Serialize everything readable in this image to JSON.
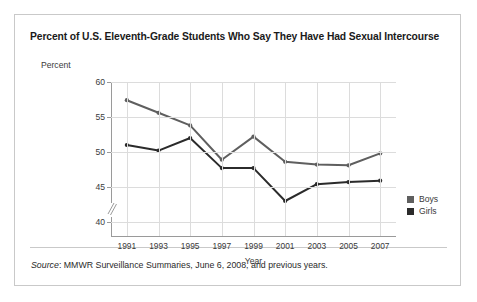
{
  "figure": {
    "title": "Percent of U.S. Eleventh-Grade Students Who Say They Have Had Sexual Intercourse",
    "source_word": "Source",
    "source_text": ": MMWR Surveillance Summaries, June 6, 2008, and previous years."
  },
  "chart_data": {
    "type": "line",
    "title": "Percent of U.S. Eleventh-Grade Students Who Say They Have Had Sexual Intercourse",
    "xlabel": "Year",
    "ylabel": "Percent",
    "categories": [
      "1991",
      "1993",
      "1995",
      "1997",
      "1999",
      "2001",
      "2003",
      "2005",
      "2007"
    ],
    "x": [
      1991,
      1993,
      1995,
      1997,
      1999,
      2001,
      2003,
      2005,
      2007
    ],
    "ylim": [
      38,
      60
    ],
    "yticks": [
      40,
      45,
      50,
      55,
      60
    ],
    "ytick_labels": [
      "40",
      "45",
      "50",
      "55",
      "60"
    ],
    "xlim": [
      1990,
      2008
    ],
    "grid": true,
    "axis_break": true,
    "legend_position": "right",
    "series": [
      {
        "name": "Boys",
        "color": "#5f5f5f",
        "values": [
          57.4,
          55.6,
          53.8,
          48.9,
          52.2,
          48.6,
          48.2,
          48.1,
          49.8
        ]
      },
      {
        "name": "Girls",
        "color": "#2b2b2b",
        "values": [
          51.0,
          50.2,
          52.0,
          47.7,
          47.7,
          43.0,
          45.4,
          45.7,
          45.9
        ]
      }
    ]
  },
  "legend": {
    "items": [
      {
        "label": "Boys",
        "color": "#5f5f5f"
      },
      {
        "label": "Girls",
        "color": "#2b2b2b"
      }
    ]
  }
}
